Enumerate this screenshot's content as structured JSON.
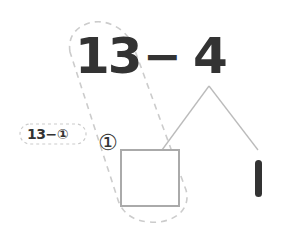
{
  "problem": {
    "minuend": "13",
    "operator": "−",
    "subtrahend": "4"
  },
  "decomposition": {
    "left_part_marker": "①",
    "right_part": "1",
    "answer_box": ""
  },
  "hint_label": {
    "text": "13−①"
  },
  "colors": {
    "text": "#333333",
    "lines": "#bbbbbb",
    "dashed": "#cccccc",
    "box_border": "#aaaaaa"
  }
}
